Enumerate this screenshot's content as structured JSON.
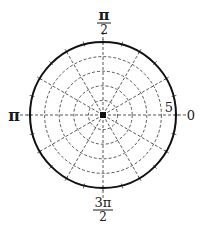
{
  "diagram": {
    "type": "polar-grid",
    "center": {
      "x": 103,
      "y": 115
    },
    "outer_radius_px": 73,
    "max_radius_value": 5,
    "ring_count": 5,
    "ring_values": [
      1,
      2,
      3,
      4,
      5
    ],
    "spoke_step_degrees": 30,
    "tick_step_degrees": 15,
    "colors": {
      "outer_circle": "#111111",
      "grid": "#444444",
      "center_dot": "#111111",
      "text": "#1a1a1a"
    }
  },
  "labels": {
    "angle_0": "0",
    "angle_half_pi_num": "π",
    "angle_half_pi_den": "2",
    "angle_pi": "π",
    "angle_three_half_pi_num": "3π",
    "angle_three_half_pi_den": "2",
    "radius_max": "5"
  }
}
